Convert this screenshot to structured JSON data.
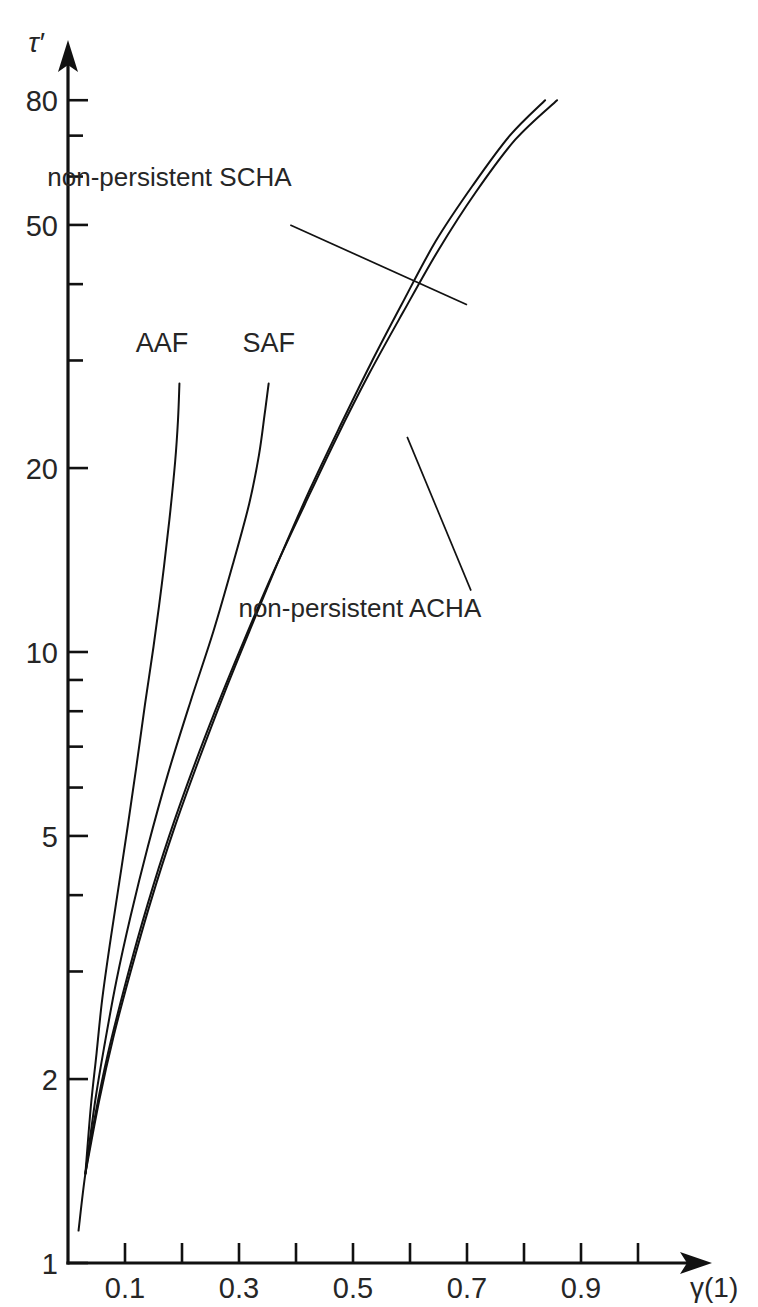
{
  "chart_data": {
    "type": "line",
    "title": "",
    "xlabel": "γ(1)",
    "ylabel": "τ′",
    "yscale": "log",
    "xscale": "linear",
    "xlim": [
      0.0,
      1.05
    ],
    "ylim": [
      1,
      90
    ],
    "grid": false,
    "legend_position": "inline-annotations",
    "x_ticks_major": [
      0.1,
      0.3,
      0.5,
      0.7,
      0.9
    ],
    "x_tick_labels": [
      "0.1",
      "0.3",
      "0.5",
      "0.7",
      "0.9"
    ],
    "x_ticks_all": [
      0.1,
      0.2,
      0.3,
      0.4,
      0.5,
      0.6,
      0.7,
      0.8,
      0.9,
      1.0
    ],
    "y_ticks_major": [
      1,
      2,
      5,
      10,
      20,
      50,
      80
    ],
    "y_tick_labels": [
      "1",
      "2",
      "5",
      "10",
      "20",
      "50",
      "80"
    ],
    "y_ticks_minor": [
      3,
      4,
      6,
      7,
      8,
      9,
      30,
      40,
      60,
      70
    ],
    "series": [
      {
        "name": "AAF",
        "label": "AAF",
        "label_x": 0.165,
        "label_y": 31.0,
        "points": [
          [
            0.0305,
            1.4
          ],
          [
            0.04,
            1.8
          ],
          [
            0.05,
            2.2
          ],
          [
            0.06,
            2.7
          ],
          [
            0.075,
            3.4
          ],
          [
            0.09,
            4.2
          ],
          [
            0.105,
            5.2
          ],
          [
            0.12,
            6.5
          ],
          [
            0.135,
            8.2
          ],
          [
            0.15,
            10.2
          ],
          [
            0.165,
            13.0
          ],
          [
            0.178,
            16.5
          ],
          [
            0.188,
            20.5
          ],
          [
            0.193,
            24.0
          ],
          [
            0.1955,
            27.5
          ]
        ]
      },
      {
        "name": "SAF",
        "label": "SAF",
        "label_x": 0.352,
        "label_y": 31.0,
        "points": [
          [
            0.0305,
            1.4
          ],
          [
            0.048,
            1.85
          ],
          [
            0.065,
            2.3
          ],
          [
            0.085,
            2.9
          ],
          [
            0.11,
            3.7
          ],
          [
            0.14,
            4.8
          ],
          [
            0.175,
            6.3
          ],
          [
            0.215,
            8.3
          ],
          [
            0.255,
            10.8
          ],
          [
            0.29,
            14.0
          ],
          [
            0.318,
            17.5
          ],
          [
            0.335,
            21.0
          ],
          [
            0.345,
            24.5
          ],
          [
            0.352,
            27.5
          ]
        ]
      },
      {
        "name": "non-persistent SCHA",
        "label": "non-persistent SCHA",
        "points": [
          [
            0.0305,
            1.4
          ],
          [
            0.055,
            1.85
          ],
          [
            0.08,
            2.35
          ],
          [
            0.11,
            3.0
          ],
          [
            0.145,
            3.9
          ],
          [
            0.185,
            5.1
          ],
          [
            0.228,
            6.6
          ],
          [
            0.275,
            8.6
          ],
          [
            0.325,
            11.2
          ],
          [
            0.375,
            14.5
          ],
          [
            0.425,
            18.5
          ],
          [
            0.478,
            23.5
          ],
          [
            0.53,
            29.5
          ],
          [
            0.585,
            37.0
          ],
          [
            0.645,
            47.0
          ],
          [
            0.71,
            58.0
          ],
          [
            0.775,
            70.0
          ],
          [
            0.837,
            80.0
          ]
        ]
      },
      {
        "name": "non-persistent ACHA",
        "label": "non-persistent ACHA",
        "points": [
          [
            0.0185,
            1.13
          ],
          [
            0.0305,
            1.4
          ],
          [
            0.048,
            1.75
          ],
          [
            0.07,
            2.2
          ],
          [
            0.098,
            2.8
          ],
          [
            0.13,
            3.6
          ],
          [
            0.168,
            4.7
          ],
          [
            0.21,
            6.1
          ],
          [
            0.258,
            8.0
          ],
          [
            0.308,
            10.4
          ],
          [
            0.36,
            13.5
          ],
          [
            0.415,
            17.4
          ],
          [
            0.47,
            22.3
          ],
          [
            0.528,
            28.5
          ],
          [
            0.588,
            36.0
          ],
          [
            0.65,
            45.5
          ],
          [
            0.715,
            56.5
          ],
          [
            0.785,
            69.0
          ],
          [
            0.858,
            80.0
          ]
        ]
      }
    ],
    "annotations": [
      {
        "id": "scha-callout",
        "text": "non-persistent SCHA",
        "text_x": 0.178,
        "text_y": 58.0,
        "leader_from": [
          0.39,
          50.0
        ],
        "leader_to": [
          0.7,
          37.0
        ]
      },
      {
        "id": "acha-callout",
        "text": "non-persistent ACHA",
        "text_x": 0.512,
        "text_y": 11.4,
        "leader_from": [
          0.707,
          12.6
        ],
        "leader_to": [
          0.595,
          22.5
        ]
      }
    ]
  }
}
